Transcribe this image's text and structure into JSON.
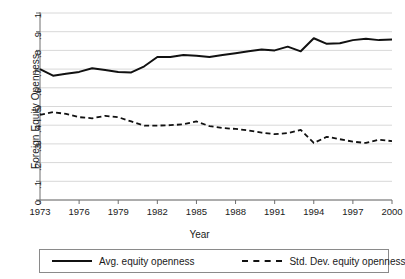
{
  "chart_data": {
    "type": "line",
    "title": "",
    "xlabel": "Year",
    "ylabel": "Foreign Equity Openness",
    "xlim": [
      1973,
      2000
    ],
    "ylim": [
      0,
      1
    ],
    "grid": true,
    "grid_axis": "y",
    "legend_position": "below",
    "x": [
      1973,
      1974,
      1975,
      1976,
      1977,
      1978,
      1979,
      1980,
      1981,
      1982,
      1983,
      1984,
      1985,
      1986,
      1987,
      1988,
      1989,
      1990,
      1991,
      1992,
      1993,
      1994,
      1995,
      1996,
      1997,
      1998,
      1999,
      2000
    ],
    "xticks": [
      1973,
      1976,
      1979,
      1982,
      1985,
      1988,
      1991,
      1994,
      1997,
      2000
    ],
    "yticks": [
      "0",
      ".1",
      ".2",
      ".3",
      ".4",
      ".5",
      ".6",
      ".7",
      ".8",
      ".9",
      "1"
    ],
    "ytick_values": [
      0,
      0.1,
      0.2,
      0.3,
      0.4,
      0.5,
      0.6,
      0.7,
      0.8,
      0.9,
      1
    ],
    "series": [
      {
        "name": "Avg. equity openness",
        "style": "solid",
        "color": "#111111",
        "values": [
          0.7,
          0.665,
          0.675,
          0.685,
          0.705,
          0.695,
          0.685,
          0.682,
          0.715,
          0.765,
          0.765,
          0.775,
          0.772,
          0.765,
          0.775,
          0.785,
          0.795,
          0.805,
          0.8,
          0.82,
          0.795,
          0.865,
          0.835,
          0.838,
          0.855,
          0.862,
          0.855,
          0.858
        ]
      },
      {
        "name": "Std. Dev. equity openness",
        "style": "dashed",
        "color": "#111111",
        "values": [
          0.455,
          0.47,
          0.46,
          0.443,
          0.437,
          0.45,
          0.443,
          0.42,
          0.398,
          0.398,
          0.4,
          0.405,
          0.42,
          0.395,
          0.385,
          0.38,
          0.372,
          0.36,
          0.352,
          0.358,
          0.375,
          0.305,
          0.338,
          0.325,
          0.312,
          0.305,
          0.322,
          0.315
        ]
      }
    ]
  },
  "legend": {
    "entries": [
      {
        "label": "Avg. equity openness"
      },
      {
        "label": "Std. Dev. equity openness"
      }
    ]
  }
}
